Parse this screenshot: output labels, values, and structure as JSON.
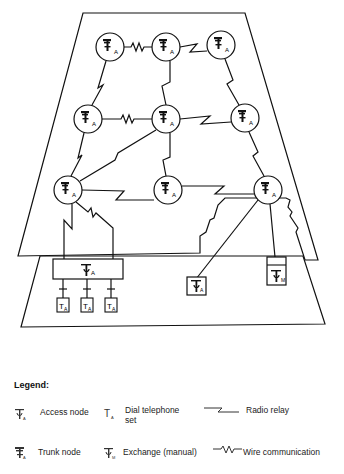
{
  "diagram": {
    "planes": [
      {
        "name": "upper-plane",
        "points": "83,13 245,13 318,260 305,260 298,237 301,228 292,216 294,214 290,207 292,201 288,197 221,197 206,210 205,222 198,227 196,235 190,238 200,255 18,256"
      },
      {
        "name": "lower-plane",
        "points": "40,256 303,256 325,324 21,327"
      }
    ],
    "trunk_nodes": [
      {
        "id": "n1",
        "x": 110,
        "y": 47,
        "label": "A"
      },
      {
        "id": "n2",
        "x": 166,
        "y": 47,
        "label": "A"
      },
      {
        "id": "n3",
        "x": 221,
        "y": 45,
        "label": "A"
      },
      {
        "id": "n4",
        "x": 88,
        "y": 119,
        "label": "A"
      },
      {
        "id": "n5",
        "x": 166,
        "y": 119,
        "label": "A"
      },
      {
        "id": "n6",
        "x": 245,
        "y": 118,
        "label": "A"
      },
      {
        "id": "n7",
        "x": 68,
        "y": 190,
        "label": "A"
      },
      {
        "id": "n8",
        "x": 168,
        "y": 190,
        "label": "A"
      },
      {
        "id": "n9",
        "x": 268,
        "y": 190,
        "label": "A"
      }
    ],
    "links": [
      {
        "from": "n1",
        "to": "n2",
        "type": "wire"
      },
      {
        "from": "n2",
        "to": "n3",
        "type": "radio"
      },
      {
        "from": "n1",
        "to": "n4",
        "type": "radio"
      },
      {
        "from": "n2",
        "to": "n5",
        "type": "radio"
      },
      {
        "from": "n3",
        "to": "n6",
        "type": "radio"
      },
      {
        "from": "n4",
        "to": "n5",
        "type": "wire"
      },
      {
        "from": "n5",
        "to": "n6",
        "type": "radio"
      },
      {
        "from": "n4",
        "to": "n7",
        "type": "radio"
      },
      {
        "from": "n5",
        "to": "n7",
        "type": "radio"
      },
      {
        "from": "n5",
        "to": "n8",
        "type": "radio"
      },
      {
        "from": "n6",
        "to": "n9",
        "type": "radio"
      },
      {
        "from": "n7",
        "to": "n8",
        "type": "radio"
      },
      {
        "from": "n8",
        "to": "n9",
        "type": "radio"
      }
    ],
    "access_node_main": {
      "label": "A"
    },
    "dial_phones": [
      {
        "label": "A"
      },
      {
        "label": "A"
      },
      {
        "label": "A"
      }
    ],
    "access_node_small": {
      "label": "A"
    },
    "exchange_manual": {
      "label": "M"
    }
  },
  "legend": {
    "title": "Legend:",
    "items": [
      {
        "icon": "access-node-icon",
        "label": "Access node"
      },
      {
        "icon": "dial-telephone-icon",
        "label": "Dial telephone set"
      },
      {
        "icon": "radio-relay-icon",
        "label": "Radio relay"
      },
      {
        "icon": "trunk-node-icon",
        "label": "Trunk node"
      },
      {
        "icon": "exchange-manual-icon",
        "label": "Exchange (manual)"
      },
      {
        "icon": "wire-communication-icon",
        "label": "Wire communication"
      }
    ],
    "dial_line1": "Dial telephone",
    "dial_line2": "set"
  }
}
